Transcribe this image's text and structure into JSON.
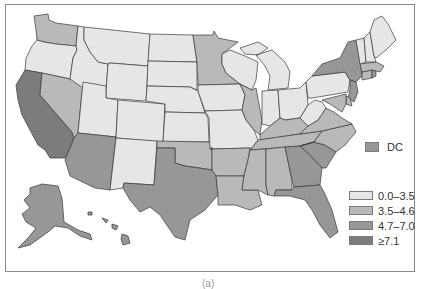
{
  "colors": {
    "bin1": "#e6e6e6",
    "bin2": "#b9b9b9",
    "bin3": "#979797",
    "bin4": "#7c7c7c",
    "border": "#3a3a3a",
    "frame": "#8a8a8a"
  },
  "legend": {
    "items": [
      {
        "label": "0.0–3.5",
        "bin": "bin1"
      },
      {
        "label": "3.5–4.6",
        "bin": "bin2"
      },
      {
        "label": "4.7–7.0",
        "bin": "bin3"
      },
      {
        "label": "≥7.1",
        "bin": "bin4"
      }
    ]
  },
  "dc": {
    "label": "DC",
    "bin": "bin3"
  },
  "caption": "(a)",
  "states": {
    "WA": "bin2",
    "OR": "bin1",
    "CA": "bin4",
    "NV": "bin2",
    "ID": "bin1",
    "MT": "bin1",
    "WY": "bin1",
    "UT": "bin1",
    "AZ": "bin3",
    "CO": "bin1",
    "NM": "bin1",
    "ND": "bin1",
    "SD": "bin1",
    "NE": "bin1",
    "KS": "bin1",
    "OK": "bin2",
    "TX": "bin3",
    "MN": "bin2",
    "IA": "bin1",
    "MO": "bin1",
    "AR": "bin2",
    "LA": "bin2",
    "WI": "bin1",
    "IL": "bin2",
    "MI": "bin1",
    "IN": "bin1",
    "OH": "bin1",
    "KY": "bin2",
    "TN": "bin2",
    "MS": "bin2",
    "AL": "bin2",
    "GA": "bin3",
    "FL": "bin3",
    "SC": "bin3",
    "NC": "bin2",
    "VA": "bin2",
    "WV": "bin1",
    "PA": "bin1",
    "NY": "bin3",
    "VT": "bin1",
    "NH": "bin1",
    "ME": "bin1",
    "MA": "bin2",
    "CT": "bin2",
    "RI": "bin3",
    "NJ": "bin3",
    "DE": "bin2",
    "MD": "bin2",
    "AK": "bin3",
    "HI": "bin3"
  }
}
